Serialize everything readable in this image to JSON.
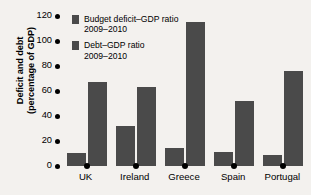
{
  "chart_data": {
    "type": "bar",
    "title": "",
    "xlabel": "",
    "ylabel_line1": "Deficit and debt",
    "ylabel_line2": "(percentage of GDP)",
    "ylim": [
      0,
      120
    ],
    "yticks": [
      0,
      20,
      40,
      60,
      80,
      100,
      120
    ],
    "ytick_labels": [
      "0",
      "20",
      "40",
      "60",
      "80",
      "100",
      "120"
    ],
    "grid": false,
    "legend_position": "top-left",
    "categories": [
      "UK",
      "Ireland",
      "Greece",
      "Spain",
      "Portugal"
    ],
    "series": [
      {
        "name": "Budget deficit–GDP ratio 2009–2010",
        "name_line1": "Budget deficit–GDP ratio",
        "name_line2": "2009–2010",
        "color": "#4a4a4a",
        "values": [
          10.5,
          32,
          14.5,
          11,
          9
        ]
      },
      {
        "name": "Debt–GDP ratio 2009–2010",
        "name_line1": "Debt–GDP ratio",
        "name_line2": "2009–2010",
        "color": "#4a4a4a",
        "values": [
          67,
          63,
          115,
          52,
          76
        ]
      }
    ]
  },
  "colors": {
    "background": "#f3f1ee",
    "bar": "#4a4a4a",
    "text": "#000000"
  }
}
